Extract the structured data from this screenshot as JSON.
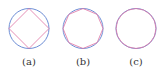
{
  "figure": {
    "colors": {
      "circle": "#6f8fd6",
      "polygon": "#e07aa8"
    },
    "panels": [
      {
        "label": "(a)",
        "polygon_sides": 4,
        "rotation_deg": 0
      },
      {
        "label": "(b)",
        "polygon_sides": 8,
        "rotation_deg": 0
      },
      {
        "label": "(c)",
        "polygon_sides": 16,
        "rotation_deg": 0
      }
    ]
  }
}
